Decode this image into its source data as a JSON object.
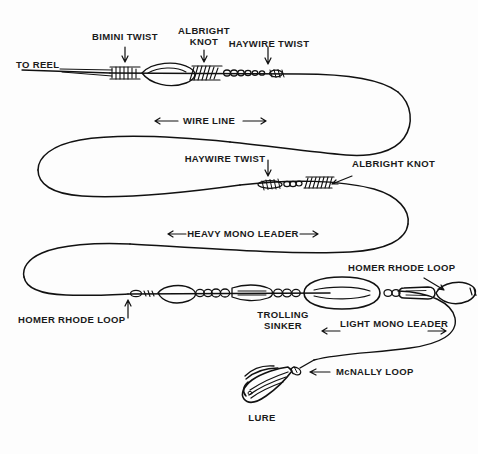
{
  "diagram": {
    "background_color": "#fdfdfd",
    "ink_color": "#111111",
    "labels": {
      "to_reel": "TO REEL",
      "bimini_twist": "BIMINI TWIST",
      "albright_knot_top": "ALBRIGHT\nKNOT",
      "haywire_twist_top": "HAYWIRE TWIST",
      "wire_line": "WIRE LINE",
      "haywire_twist_mid": "HAYWIRE TWIST",
      "albright_knot_mid": "ALBRIGHT KNOT",
      "heavy_mono_leader": "HEAVY MONO LEADER",
      "homer_rhode_loop_right": "HOMER RHODE LOOP",
      "homer_rhode_loop_left": "HOMER RHODE LOOP",
      "trolling_sinker": "TROLLING\nSINKER",
      "light_mono_leader": "LIGHT MONO LEADER",
      "mcnally_loop": "McNALLY LOOP",
      "lure": "LURE"
    },
    "arrow_glyphs": {
      "left": "←",
      "right": "→",
      "down": "↓",
      "up": "↑"
    },
    "components": [
      {
        "name": "bimini-twist",
        "type": "knot"
      },
      {
        "name": "albright-knot-top",
        "type": "knot"
      },
      {
        "name": "haywire-twist-top",
        "type": "knot"
      },
      {
        "name": "haywire-twist-mid",
        "type": "knot"
      },
      {
        "name": "albright-knot-mid",
        "type": "knot"
      },
      {
        "name": "homer-rhode-loop-left",
        "type": "loop"
      },
      {
        "name": "trolling-sinker",
        "type": "weight"
      },
      {
        "name": "snap-swivel",
        "type": "hardware"
      },
      {
        "name": "homer-rhode-loop-right",
        "type": "loop"
      },
      {
        "name": "mcnally-loop",
        "type": "loop"
      },
      {
        "name": "lure",
        "type": "lure"
      }
    ]
  }
}
